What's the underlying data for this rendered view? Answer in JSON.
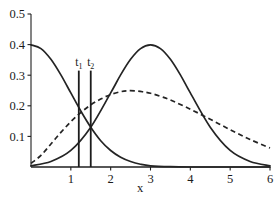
{
  "chart_data": {
    "type": "line",
    "title": "",
    "xlabel": "x",
    "ylabel": "",
    "xlim": [
      0,
      6
    ],
    "ylim": [
      0,
      0.5
    ],
    "grid": false,
    "legend": "none",
    "x_ticks": [
      "1",
      "2",
      "3",
      "4",
      "5",
      "6"
    ],
    "x_tick_values": [
      1,
      2,
      3,
      4,
      5,
      6
    ],
    "y_ticks": [
      "0.1",
      "0.2",
      "0.3",
      "0.4",
      "0.5"
    ],
    "y_tick_values": [
      0.1,
      0.2,
      0.3,
      0.4,
      0.5
    ],
    "series": [
      {
        "name": "left-decaying-density",
        "style": "solid",
        "color": "#242424",
        "x": [
          0,
          0.25,
          0.5,
          0.75,
          1.0,
          1.25,
          1.5,
          1.75,
          2.0,
          2.25,
          2.5,
          2.75,
          3.0,
          3.5,
          4.0,
          4.5,
          5.0,
          5.5,
          6.0
        ],
        "values": [
          0.399,
          0.387,
          0.352,
          0.301,
          0.242,
          0.183,
          0.13,
          0.086,
          0.054,
          0.032,
          0.018,
          0.009,
          0.004,
          0.001,
          0.0,
          0.0,
          0.0,
          0.0,
          0.0
        ]
      },
      {
        "name": "right-bell-density",
        "style": "solid",
        "color": "#242424",
        "x": [
          0,
          0.5,
          1.0,
          1.5,
          2.0,
          2.25,
          2.5,
          2.75,
          3.0,
          3.25,
          3.5,
          3.75,
          4.0,
          4.5,
          5.0,
          5.5,
          6.0
        ],
        "values": [
          0.004,
          0.018,
          0.054,
          0.13,
          0.242,
          0.301,
          0.352,
          0.387,
          0.399,
          0.387,
          0.352,
          0.301,
          0.242,
          0.13,
          0.054,
          0.018,
          0.004
        ]
      },
      {
        "name": "broad-dashed-density",
        "style": "dashed",
        "color": "#242424",
        "x": [
          0,
          0.25,
          0.5,
          0.75,
          1.0,
          1.25,
          1.5,
          1.75,
          2.0,
          2.25,
          2.4,
          2.6,
          2.8,
          3.0,
          3.25,
          3.5,
          4.0,
          4.5,
          5.0,
          5.5,
          6.0
        ],
        "values": [
          0.012,
          0.038,
          0.075,
          0.113,
          0.148,
          0.178,
          0.203,
          0.222,
          0.237,
          0.246,
          0.249,
          0.249,
          0.246,
          0.241,
          0.231,
          0.219,
          0.189,
          0.156,
          0.122,
          0.09,
          0.062
        ]
      }
    ],
    "vertical_markers": [
      {
        "label": "t",
        "subscript": "1",
        "x": 1.2,
        "y_top": 0.315,
        "y_bottom": 0.0
      },
      {
        "label": "t",
        "subscript": "2",
        "x": 1.5,
        "y_top": 0.315,
        "y_bottom": 0.0
      }
    ],
    "intersections": [
      {
        "x": 1.5,
        "y": 0.13
      },
      {
        "x": 4.4,
        "y": 0.135
      }
    ]
  },
  "colors": {
    "curve": "#242424",
    "axis": "#1f1f1f",
    "text": "#1b1b1b",
    "background": "#ffffff"
  }
}
